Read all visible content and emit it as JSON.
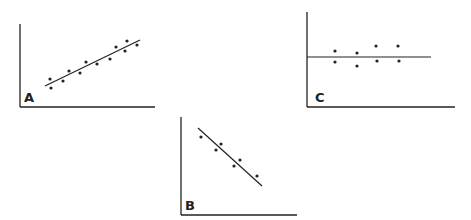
{
  "chart_data": [
    {
      "type": "scatter",
      "label": "A",
      "description": "Positive linear correlation",
      "axes": {
        "origin": [
          20,
          107
        ],
        "y_top": 24,
        "x_right": 155
      },
      "trend_line": [
        [
          45,
          86
        ],
        [
          140,
          40
        ]
      ],
      "points": [
        [
          50,
          79
        ],
        [
          51,
          88
        ],
        [
          63,
          81
        ],
        [
          69,
          71
        ],
        [
          80,
          73
        ],
        [
          86,
          62
        ],
        [
          97,
          64
        ],
        [
          110,
          59
        ],
        [
          116,
          47
        ],
        [
          125,
          51
        ],
        [
          127,
          41
        ],
        [
          137,
          45
        ]
      ],
      "grid": false,
      "tick_labels": false
    },
    {
      "type": "scatter",
      "label": "B",
      "description": "Negative linear correlation",
      "axes": {
        "origin": [
          181,
          215
        ],
        "y_top": 117,
        "x_right": 297
      },
      "trend_line": [
        [
          198,
          128
        ],
        [
          262,
          186
        ]
      ],
      "points": [
        [
          201,
          137
        ],
        [
          216,
          150
        ],
        [
          221,
          144
        ],
        [
          234,
          166
        ],
        [
          240,
          160
        ],
        [
          257,
          176
        ]
      ],
      "grid": false,
      "tick_labels": false
    },
    {
      "type": "scatter",
      "label": "C",
      "description": "No correlation (horizontal trend line)",
      "axes": {
        "origin": [
          307,
          107
        ],
        "y_top": 12,
        "x_right": 455
      },
      "trend_line": [
        [
          307,
          57
        ],
        [
          431,
          57
        ]
      ],
      "points": [
        [
          335,
          51
        ],
        [
          335,
          62
        ],
        [
          357,
          53
        ],
        [
          357,
          66
        ],
        [
          376,
          46
        ],
        [
          377,
          61
        ],
        [
          398,
          46
        ],
        [
          399,
          61
        ]
      ],
      "grid": false,
      "tick_labels": false
    }
  ],
  "labels": {
    "a": "A",
    "b": "B",
    "c": "C"
  },
  "colors": {
    "ink": "#222222",
    "background": "#ffffff"
  }
}
